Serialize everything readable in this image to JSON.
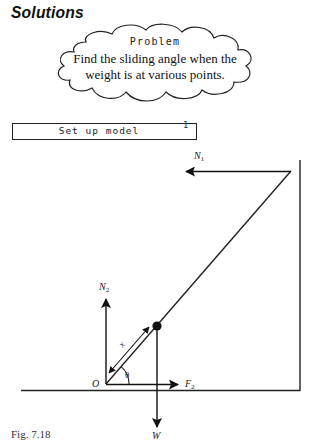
{
  "page": {
    "heading": "Solutions"
  },
  "problem": {
    "title": "Problem",
    "line1": "Find the sliding angle when the",
    "line2": "weight is at various points."
  },
  "step": {
    "label": "Set up model",
    "number": "1"
  },
  "diagram": {
    "labels": {
      "n1": "N",
      "n1_sub": "1",
      "n2": "N",
      "n2_sub": "2",
      "f2": "F",
      "f2_sub": "2",
      "w": "W",
      "origin": "O",
      "x": "x",
      "theta": "θ"
    },
    "geometry": {
      "origin": [
        106,
        384
      ],
      "ladder_top": [
        291,
        171
      ],
      "weight_point": [
        157,
        326
      ],
      "wall_x": 300,
      "floor_y": 390
    }
  },
  "caption": "Fig. 7.18"
}
